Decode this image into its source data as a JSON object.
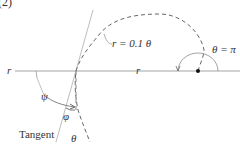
{
  "figure": {
    "panel_label": "(2)",
    "equation_label": "r = 0.1 θ",
    "theta_pi_label": "θ = π",
    "axis_label_left": "r",
    "axis_label_right": "r",
    "psi_label": "ψ",
    "phi_label": "φ",
    "theta_label": "θ",
    "tangent_label": "Tangent"
  },
  "colors": {
    "line": "#9a9a9a",
    "curve": "#666666",
    "text": "#333333",
    "dot": "#111111"
  }
}
